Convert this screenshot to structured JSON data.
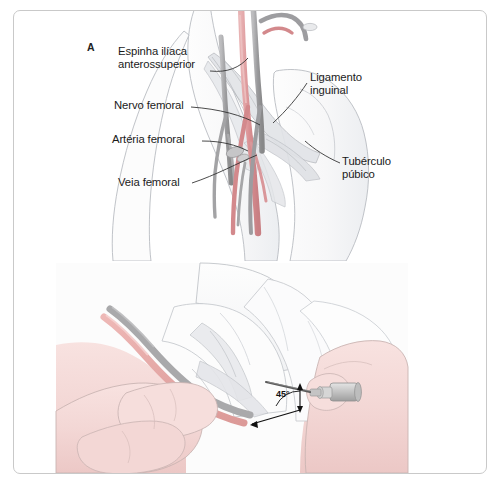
{
  "figure": {
    "frame_color": "#c9c9c9",
    "background": "#ffffff",
    "panels": [
      {
        "id": "A",
        "letter": "A",
        "caption_subject": "Anatomia da regiao inguinal - referencias para puncao femoral"
      },
      {
        "id": "B",
        "letter": "B",
        "caption_subject": "Tecnica de puncao da veia femoral com agulha a 45 graus"
      }
    ]
  },
  "panel_a": {
    "letter": "A",
    "labels": [
      {
        "id": "espinha-iliaca",
        "text": "Espinha ilíaca\nanterossuperior",
        "align": "left"
      },
      {
        "id": "nervo-femoral",
        "text": "Nervo femoral",
        "align": "left"
      },
      {
        "id": "arteria-femoral",
        "text": "Artéria femoral",
        "align": "left"
      },
      {
        "id": "veia-femoral",
        "text": "Veia femoral",
        "align": "left"
      },
      {
        "id": "ligamento-inguinal",
        "text": "Ligamento\ninguinal",
        "align": "left"
      },
      {
        "id": "tuberculo-pubico",
        "text": "Tubérculo\npúbico",
        "align": "left"
      }
    ],
    "colors": {
      "artery": "#d98f92",
      "vein": "#9a9a9c",
      "nerve": "#b5b5b7",
      "skin_outline": "#b9bcc2",
      "fascia": "#d6d8dc",
      "leader_line": "#2b2b2b"
    }
  },
  "panel_b": {
    "letter": "B",
    "angle_label": "45°",
    "colors": {
      "skin": "#f3d7d5",
      "skin_outline": "#c9b4b2",
      "artery": "#e3a7a5",
      "vein": "#a9a9ab",
      "needle": "#4a4a4a",
      "syringe": "#c8c8c8",
      "arrow": "#111111",
      "plate_bg": "#fbfbfb"
    }
  }
}
